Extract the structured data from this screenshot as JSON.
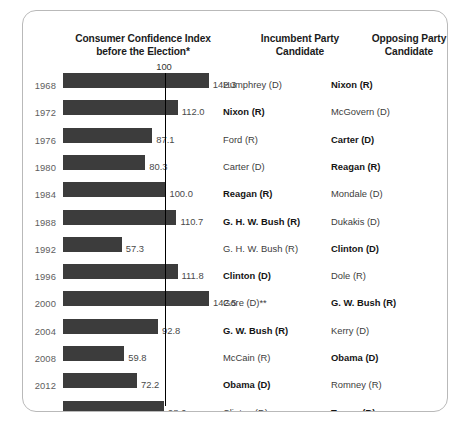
{
  "chart_data": {
    "type": "bar",
    "title": "Consumer Confidence Index before the Election*",
    "xlabel": "",
    "ylabel": "",
    "orientation": "horizontal",
    "grid": false,
    "legend": null,
    "reference_line": {
      "value": 100,
      "label": "100"
    },
    "xlim": [
      0,
      150
    ],
    "categories": [
      "1968",
      "1972",
      "1976",
      "1980",
      "1984",
      "1988",
      "1992",
      "1996",
      "2000",
      "2004",
      "2008",
      "2012",
      "2016"
    ],
    "values": [
      142.3,
      112.0,
      87.1,
      80.3,
      100.0,
      110.7,
      57.3,
      111.8,
      142.5,
      92.8,
      59.8,
      72.2,
      98.6
    ],
    "annotations": [
      "Bold candidate name indicates the winner of the election",
      "* Consumer Confidence Index measured before the election",
      "** Gore (D) won the popular vote"
    ]
  },
  "header": {
    "col_cci": "Consumer Confidence Index before the Election*",
    "col_cci_line1": "Consumer Confidence Index",
    "col_cci_line2": "before the Election*",
    "col_incumbent_line1": "Incumbent Party",
    "col_incumbent_line2": "Candidate",
    "col_opposing_line1": "Opposing Party",
    "col_opposing_line2": "Candidate",
    "tick_100": "100"
  },
  "rows": [
    {
      "year": "1968",
      "value": 142.3,
      "value_label": "142.3",
      "incumbent": "Humphrey (D)",
      "incumbent_won": false,
      "opposing": "Nixon (R)",
      "opposing_won": true
    },
    {
      "year": "1972",
      "value": 112.0,
      "value_label": "112.0",
      "incumbent": "Nixon (R)",
      "incumbent_won": true,
      "opposing": "McGovern (D)",
      "opposing_won": false
    },
    {
      "year": "1976",
      "value": 87.1,
      "value_label": "87.1",
      "incumbent": "Ford (R)",
      "incumbent_won": false,
      "opposing": "Carter (D)",
      "opposing_won": true
    },
    {
      "year": "1980",
      "value": 80.3,
      "value_label": "80.3",
      "incumbent": "Carter (D)",
      "incumbent_won": false,
      "opposing": "Reagan (R)",
      "opposing_won": true
    },
    {
      "year": "1984",
      "value": 100.0,
      "value_label": "100.0",
      "incumbent": "Reagan (R)",
      "incumbent_won": true,
      "opposing": "Mondale (D)",
      "opposing_won": false
    },
    {
      "year": "1988",
      "value": 110.7,
      "value_label": "110.7",
      "incumbent": "G. H. W. Bush (R)",
      "incumbent_won": true,
      "opposing": "Dukakis (D)",
      "opposing_won": false
    },
    {
      "year": "1992",
      "value": 57.3,
      "value_label": "57.3",
      "incumbent": "G. H. W. Bush (R)",
      "incumbent_won": false,
      "opposing": "Clinton (D)",
      "opposing_won": true
    },
    {
      "year": "1996",
      "value": 111.8,
      "value_label": "111.8",
      "incumbent": "Clinton (D)",
      "incumbent_won": true,
      "opposing": "Dole (R)",
      "opposing_won": false
    },
    {
      "year": "2000",
      "value": 142.5,
      "value_label": "142.5",
      "incumbent": "Gore (D)**",
      "incumbent_won": false,
      "opposing": "G. W. Bush (R)",
      "opposing_won": true
    },
    {
      "year": "2004",
      "value": 92.8,
      "value_label": "92.8",
      "incumbent": "G. W. Bush (R)",
      "incumbent_won": true,
      "opposing": "Kerry (D)",
      "opposing_won": false
    },
    {
      "year": "2008",
      "value": 59.8,
      "value_label": "59.8",
      "incumbent": "McCain (R)",
      "incumbent_won": false,
      "opposing": "Obama (D)",
      "opposing_won": true
    },
    {
      "year": "2012",
      "value": 72.2,
      "value_label": "72.2",
      "incumbent": "Obama (D)",
      "incumbent_won": true,
      "opposing": "Romney (R)",
      "opposing_won": false
    },
    {
      "year": "2016",
      "value": 98.6,
      "value_label": "98.6",
      "incumbent": "Clinton (D)",
      "incumbent_won": false,
      "opposing": "Trump (R)",
      "opposing_won": true
    }
  ],
  "colors": {
    "bar": "#3c3c3c",
    "reference_line": "#000000",
    "card_border": "#b9b9b9",
    "background": "#ffffff",
    "year_text": "#5e5e5e",
    "value_text": "#4a4a4a"
  }
}
